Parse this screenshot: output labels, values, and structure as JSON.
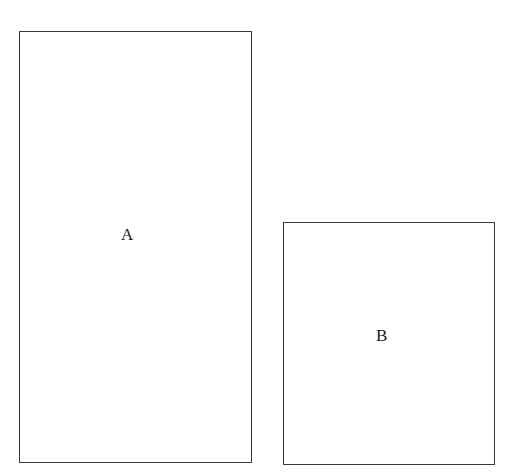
{
  "diagram": {
    "shapes": [
      {
        "id": "A",
        "type": "rectangle",
        "label": "A"
      },
      {
        "id": "B",
        "type": "rectangle",
        "label": "B"
      }
    ],
    "colors": {
      "stroke": "#3a3a3a",
      "background": "#ffffff",
      "text": "#1a1a1a"
    }
  }
}
